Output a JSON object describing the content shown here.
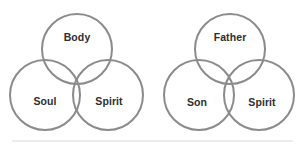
{
  "diagrams": [
    {
      "name": "body-soul-spirit",
      "type": "venn-3-circle",
      "labels": {
        "top": "Body",
        "bottom_left": "Soul",
        "bottom_right": "Spirit"
      }
    },
    {
      "name": "father-son-spirit",
      "type": "venn-3-circle",
      "labels": {
        "top": "Father",
        "bottom_left": "Son",
        "bottom_right": "Spirit"
      }
    }
  ],
  "style": {
    "circle_stroke_color": "#8b8b8b",
    "label_color": "#2e2e2e",
    "background": "#ffffff"
  }
}
